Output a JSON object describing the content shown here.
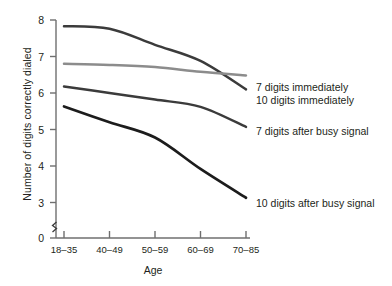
{
  "chart_data": {
    "type": "line",
    "title": "",
    "xlabel": "Age",
    "ylabel": "Number of digits correctly dialed",
    "categories": [
      "18–35",
      "40–49",
      "50–59",
      "60–69",
      "70–85"
    ],
    "ytick_labels": [
      "0",
      "3",
      "4",
      "5",
      "6",
      "7",
      "8"
    ],
    "ylim": [
      3,
      8
    ],
    "y_axis_break": true,
    "grid": false,
    "legend_position": "right-inline",
    "series": [
      {
        "name": "7 digits immediately",
        "color": "#3b3b3b",
        "values": [
          7.83,
          7.76,
          7.32,
          6.88,
          6.1
        ]
      },
      {
        "name": "10 digits immediately",
        "color": "#8c8c8c",
        "values": [
          6.8,
          6.77,
          6.71,
          6.58,
          6.48
        ]
      },
      {
        "name": "7 digits after busy signal",
        "color": "#3b3b3b",
        "values": [
          6.18,
          6.0,
          5.82,
          5.62,
          5.07
        ]
      },
      {
        "name": "10 digits after busy signal",
        "color": "#1c1c1c",
        "values": [
          5.63,
          5.2,
          4.78,
          3.92,
          3.13
        ]
      }
    ]
  },
  "labels": {
    "series_0": "7 digits immediately",
    "series_1": "10 digits immediately",
    "series_2": "7 digits after busy signal",
    "series_3": "10 digits after busy signal"
  },
  "axis": {
    "x_title": "Age",
    "y_title": "Number of digits correctly dialed",
    "x_ticks": [
      "18–35",
      "40–49",
      "50–59",
      "60–69",
      "70–85"
    ],
    "y_ticks": [
      "8",
      "7",
      "6",
      "5",
      "4",
      "3",
      "0"
    ]
  },
  "colors": {
    "axis": "#6f6f6f",
    "dark_line": "#3b3b3b",
    "darkest_line": "#1c1c1c",
    "gray_line": "#8c8c8c",
    "text": "#231f20"
  }
}
